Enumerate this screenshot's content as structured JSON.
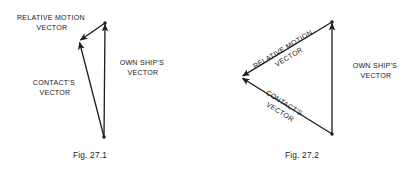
{
  "page": {
    "background_color": "#ffffff",
    "ink_color": "#1a1a1a"
  },
  "figures": [
    {
      "id": "fig-27-1",
      "caption": "Fig. 27.1",
      "caption_pos": {
        "x": 90,
        "y": 156
      },
      "geometry": {
        "apex_top": {
          "x": 105,
          "y": 23
        },
        "apex_left": {
          "x": 79,
          "y": 41
        },
        "apex_bottom": {
          "x": 104,
          "y": 137
        }
      },
      "vectors": [
        {
          "name": "relative-motion-vector",
          "from": {
            "x": 105,
            "y": 23
          },
          "to": {
            "x": 80.5,
            "y": 40
          },
          "arrow_at": "to"
        },
        {
          "name": "contacts-vector",
          "from": {
            "x": 104,
            "y": 137
          },
          "to": {
            "x": 79.6,
            "y": 42.5
          },
          "arrow_at": "to"
        },
        {
          "name": "own-ships-vector",
          "from": {
            "x": 104,
            "y": 137
          },
          "to": {
            "x": 105,
            "y": 24.5
          },
          "arrow_at": "to"
        }
      ],
      "labels": [
        {
          "name": "relative-motion-vector-label",
          "lines": [
            "RELATIVE MOTION",
            "VECTOR"
          ],
          "x": 52,
          "y": 18,
          "rotation": 0
        },
        {
          "name": "own-ships-vector-label",
          "lines": [
            "OWN SHIP'S",
            "VECTOR"
          ],
          "x": 143,
          "y": 63,
          "rotation": 0
        },
        {
          "name": "contacts-vector-label",
          "lines": [
            "CONTACT'S",
            "VECTOR"
          ],
          "x": 55,
          "y": 83,
          "rotation": 0
        }
      ]
    },
    {
      "id": "fig-27-2",
      "caption": "Fig. 27.2",
      "caption_pos": {
        "x": 302,
        "y": 156
      },
      "geometry": {
        "apex_top": {
          "x": 332,
          "y": 22
        },
        "apex_left": {
          "x": 241,
          "y": 77
        },
        "apex_bottom": {
          "x": 332,
          "y": 134
        }
      },
      "vectors": [
        {
          "name": "relative-motion-vector",
          "from": {
            "x": 332,
            "y": 22
          },
          "to": {
            "x": 242.7,
            "y": 75.9
          },
          "arrow_at": "to"
        },
        {
          "name": "contacts-vector",
          "from": {
            "x": 332,
            "y": 134
          },
          "to": {
            "x": 242.5,
            "y": 78.3
          },
          "arrow_at": "to"
        },
        {
          "name": "own-ships-vector",
          "from": {
            "x": 332,
            "y": 134
          },
          "to": {
            "x": 332,
            "y": 23.5
          },
          "arrow_at": "to"
        }
      ],
      "labels": [
        {
          "name": "relative-motion-vector-label",
          "lines": [
            "RELATIVE MOTION",
            "VECTOR"
          ],
          "x": 284,
          "y": 49,
          "rotation": -31
        },
        {
          "name": "own-ships-vector-label",
          "lines": [
            "OWN SHIP'S",
            "VECTOR"
          ],
          "x": 376,
          "y": 66,
          "rotation": 0
        },
        {
          "name": "contacts-vector-label",
          "lines": [
            "CONTACT'S",
            "VECTOR"
          ],
          "x": 285,
          "y": 104,
          "rotation": 32
        }
      ]
    }
  ]
}
